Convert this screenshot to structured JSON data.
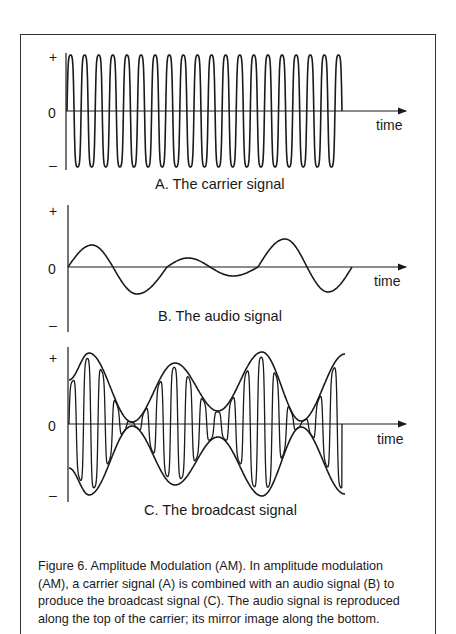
{
  "figure": {
    "panels": [
      {
        "id": "A",
        "caption": "A.  The carrier signal",
        "plus_label": "+",
        "zero_label": "0",
        "minus_label": "–",
        "x_label": "time",
        "signal": "carrier",
        "cycles": 19
      },
      {
        "id": "B",
        "caption": "B.  The audio signal",
        "plus_label": "+",
        "zero_label": "0",
        "minus_label": "–",
        "x_label": "time",
        "signal": "audio"
      },
      {
        "id": "C",
        "caption": "C.  The broadcast signal",
        "plus_label": "+",
        "zero_label": "0",
        "minus_label": "–",
        "x_label": "time",
        "signal": "broadcast"
      }
    ],
    "caption_lines": [
      "Figure 6.  Amplitude Modulation (AM).  In amplitude modulation",
      "(AM), a carrier signal (A) is combined with an audio signal (B) to",
      "produce the broadcast signal (C). The audio signal is reproduced",
      "along the top of the carrier; its mirror image along the bottom."
    ]
  },
  "colors": {
    "ink": "#1a1a1a",
    "frame": "#333333",
    "background": "#ffffff"
  }
}
